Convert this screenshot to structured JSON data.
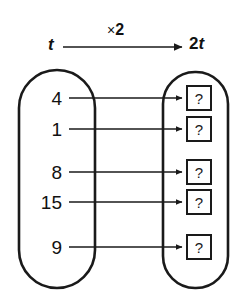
{
  "diagram": {
    "stroke_color": "#1a1a1a",
    "background_color": "#ffffff",
    "header": {
      "input_label": "t",
      "operation_symbol": "×",
      "operation_factor": "2",
      "operation_label": "×2",
      "output_coefficient": "2",
      "output_variable": "t",
      "output_label": "2t",
      "arrow_icon": "right-arrow-icon"
    },
    "input_set": {
      "shape": "oval",
      "name": "input-oval",
      "values": [
        "4",
        "1",
        "8",
        "15",
        "9"
      ]
    },
    "output_set": {
      "shape": "oval",
      "name": "output-oval",
      "values": [
        "?",
        "?",
        "?",
        "?",
        "?"
      ]
    },
    "mappings": [
      {
        "from": "4",
        "to": "?"
      },
      {
        "from": "1",
        "to": "?"
      },
      {
        "from": "8",
        "to": "?"
      },
      {
        "from": "15",
        "to": "?"
      },
      {
        "from": "9",
        "to": "?"
      }
    ]
  }
}
